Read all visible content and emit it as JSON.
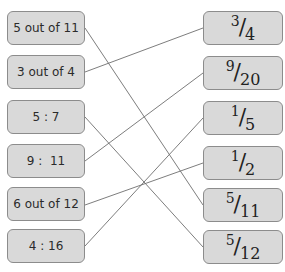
{
  "left_items": [
    {
      "label": "5 out of 11",
      "top": 11
    },
    {
      "label": "3 out of 4",
      "top": 55
    },
    {
      "label": "5 : 7",
      "top": 100
    },
    {
      "label": "9 :  11",
      "top": 144
    },
    {
      "label": "6 out of 12",
      "top": 187
    },
    {
      "label": "4 : 16",
      "top": 229
    }
  ],
  "right_items": [
    {
      "num": "3",
      "den": "4",
      "top": 11
    },
    {
      "num": "9",
      "den": "20",
      "top": 56
    },
    {
      "num": "1",
      "den": "5",
      "top": 101
    },
    {
      "num": "1",
      "den": "2",
      "top": 146
    },
    {
      "num": "5",
      "den": "11",
      "top": 188
    },
    {
      "num": "5",
      "den": "12",
      "top": 230
    }
  ],
  "connections": [
    {
      "from": "5 out of 11",
      "to": "5/11"
    },
    {
      "from": "3 out of 4",
      "to": "3/4"
    },
    {
      "from": "5 : 7",
      "to": "5/12"
    },
    {
      "from": "9 : 11",
      "to": "9/20"
    },
    {
      "from": "6 out of 12",
      "to": "1/2"
    },
    {
      "from": "4 : 16",
      "to": "1/5"
    }
  ],
  "colors": {
    "box_fill": "#d9d9d9",
    "box_border": "#8c8c8c",
    "line": "#6e6e6e"
  }
}
